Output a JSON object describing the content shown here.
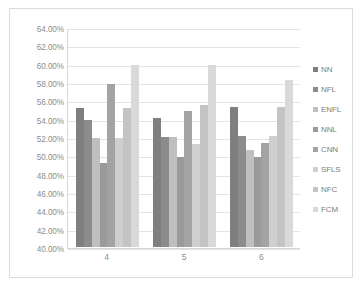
{
  "chart_data": {
    "type": "bar",
    "title": "",
    "subtitle": "",
    "xlabel": "",
    "ylabel": "",
    "categories": [
      "4",
      "5",
      "6"
    ],
    "ylim": [
      40,
      64
    ],
    "ytick_labels": [
      "64.00%",
      "62.00%",
      "60.00%",
      "58.00%",
      "56.00%",
      "54.00%",
      "52.00%",
      "50.00%",
      "48.00%",
      "46.00%",
      "44.00%",
      "42.00%",
      "40.00%"
    ],
    "ytick_values": [
      64,
      62,
      60,
      58,
      56,
      54,
      52,
      50,
      48,
      46,
      44,
      42,
      40
    ],
    "grid": true,
    "legend_position": "right",
    "value_suffix": "%",
    "series": [
      {
        "name": "NN",
        "color": "#7f7f7f",
        "values": [
          55.3,
          54.2,
          55.4
        ]
      },
      {
        "name": "NFL",
        "color": "#8c8c8c",
        "values": [
          54.0,
          52.1,
          52.2
        ]
      },
      {
        "name": "ENFL",
        "color": "#bfbfbf",
        "values": [
          52.0,
          52.1,
          50.7
        ]
      },
      {
        "name": "NNL",
        "color": "#9a9a9a",
        "values": [
          49.3,
          49.9,
          49.9
        ]
      },
      {
        "name": "CNN",
        "color": "#a3a3a3",
        "values": [
          58.0,
          55.0,
          51.5
        ]
      },
      {
        "name": "SFLS",
        "color": "#cfcfcf",
        "values": [
          52.0,
          51.3,
          52.2
        ]
      },
      {
        "name": "NFC",
        "color": "#c4c4c4",
        "values": [
          55.3,
          55.6,
          55.4
        ]
      },
      {
        "name": "FCM",
        "color": "#d9d9d9",
        "values": [
          60.0,
          60.0,
          58.4
        ]
      }
    ]
  }
}
